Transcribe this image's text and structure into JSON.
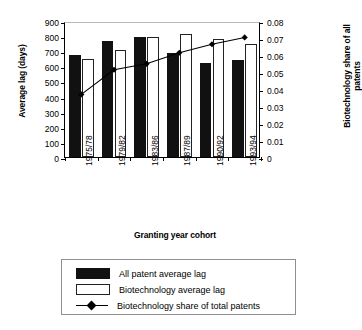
{
  "chart_data": {
    "type": "bar",
    "title": "",
    "xlabel": "Granting year cohort",
    "ylabel": "Average lag (days)",
    "ylabel_right": "Biotechnology share of all patents",
    "categories": [
      "1975/78",
      "1979/82",
      "1983/86",
      "1987/89",
      "1990/92",
      "1993/94"
    ],
    "ylim": [
      0,
      900
    ],
    "yticks": [
      "0",
      "100",
      "200",
      "300",
      "400",
      "500",
      "600",
      "700",
      "800",
      "900"
    ],
    "ylim_right": [
      0,
      0.08
    ],
    "yticks_right": [
      "0",
      "0.01",
      "0.02",
      "0.03",
      "0.04",
      "0.05",
      "0.06",
      "0.07",
      "0.08"
    ],
    "grid": false,
    "legend_position": "below",
    "series": [
      {
        "name": "All patent average lag",
        "type": "bar",
        "axis": "left",
        "color": "#111111",
        "values": [
          675,
          770,
          793,
          690,
          625,
          645
        ]
      },
      {
        "name": "Biotechnology average lag",
        "type": "bar",
        "axis": "left",
        "color": "#ffffff",
        "values": [
          650,
          710,
          797,
          815,
          780,
          750
        ]
      },
      {
        "name": "Biotechnology share of total patents",
        "type": "line",
        "axis": "right",
        "color": "#000000",
        "values": [
          0.038,
          0.0525,
          0.056,
          0.0625,
          0.0675,
          0.0715
        ]
      }
    ]
  },
  "legend": {
    "items": [
      {
        "label": "All patent average lag",
        "key": "black"
      },
      {
        "label": "Biotechnology average lag",
        "key": "white"
      },
      {
        "label": "Biotechnology share of total patents",
        "key": "line"
      }
    ]
  }
}
